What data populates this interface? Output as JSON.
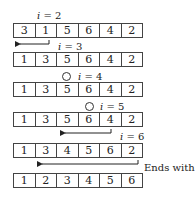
{
  "steps": [
    {
      "label_var": "i",
      "label_val": "= 2",
      "values": [
        "3",
        "1",
        "5",
        "6",
        "4",
        "2"
      ]
    },
    {
      "label_var": "i",
      "label_val": "= 3",
      "values": [
        "1",
        "3",
        "5",
        "6",
        "4",
        "2"
      ]
    },
    {
      "label_var": "i",
      "label_val": "= 4",
      "values": [
        "1",
        "3",
        "5",
        "6",
        "4",
        "2"
      ]
    },
    {
      "label_var": "i",
      "label_val": "= 5",
      "values": [
        "1",
        "3",
        "5",
        "6",
        "4",
        "2"
      ]
    },
    {
      "label_var": "i",
      "label_val": "= 6",
      "values": [
        "1",
        "3",
        "4",
        "5",
        "6",
        "2"
      ]
    }
  ],
  "final": {
    "note": "Ends with",
    "values": [
      "1",
      "2",
      "3",
      "4",
      "5",
      "6"
    ]
  },
  "icons": {
    "no_move": "circle-icon",
    "move": "arrow-left-icon"
  }
}
